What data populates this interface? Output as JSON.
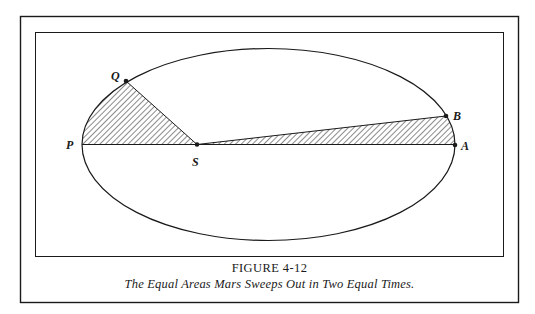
{
  "figure": {
    "number_label": "FIGURE 4-12",
    "caption": "The Equal Areas Mars Sweeps Out in Two Equal Times."
  },
  "diagram": {
    "type": "orbital-ellipse",
    "points": {
      "P": {
        "label": "P",
        "role": "perihelion"
      },
      "Q": {
        "label": "Q",
        "role": "orbit point"
      },
      "S": {
        "label": "S",
        "role": "sun / focus"
      },
      "B": {
        "label": "B",
        "role": "orbit point"
      },
      "A": {
        "label": "A",
        "role": "aphelion"
      }
    },
    "shaded_regions": [
      {
        "name": "sector-QSP",
        "vertices": [
          "Q",
          "S",
          "P"
        ]
      },
      {
        "name": "sector-BSA",
        "vertices": [
          "B",
          "S",
          "A"
        ]
      }
    ],
    "colors": {
      "ink": "#1a1a1a",
      "background": "#ffffff"
    }
  }
}
